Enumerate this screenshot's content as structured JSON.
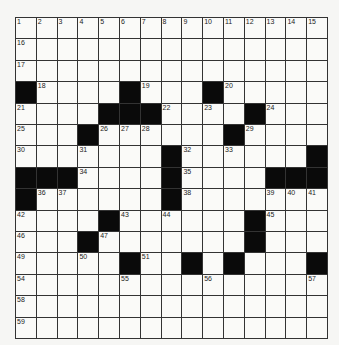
{
  "puzzle": {
    "rows": 15,
    "cols": 15,
    "grid": [
      "...............",
      "...............",
      "...............",
      "#....#...#.....",
      "....###....#...",
      "...#......#....",
      ".......#......#",
      "###....#....###",
      "#......#.......",
      "....#......#...",
      "...#.......#...",
      ".....#..#.#...#",
      "...............",
      "...............",
      "..............."
    ],
    "numbers": [
      {
        "r": 0,
        "c": 0,
        "n": "1"
      },
      {
        "r": 0,
        "c": 1,
        "n": "2"
      },
      {
        "r": 0,
        "c": 2,
        "n": "3"
      },
      {
        "r": 0,
        "c": 3,
        "n": "4"
      },
      {
        "r": 0,
        "c": 4,
        "n": "5"
      },
      {
        "r": 0,
        "c": 5,
        "n": "6"
      },
      {
        "r": 0,
        "c": 6,
        "n": "7"
      },
      {
        "r": 0,
        "c": 7,
        "n": "8"
      },
      {
        "r": 0,
        "c": 8,
        "n": "9"
      },
      {
        "r": 0,
        "c": 9,
        "n": "10"
      },
      {
        "r": 0,
        "c": 10,
        "n": "11"
      },
      {
        "r": 0,
        "c": 11,
        "n": "12"
      },
      {
        "r": 0,
        "c": 12,
        "n": "13"
      },
      {
        "r": 0,
        "c": 13,
        "n": "14"
      },
      {
        "r": 0,
        "c": 14,
        "n": "15"
      },
      {
        "r": 1,
        "c": 0,
        "n": "16"
      },
      {
        "r": 2,
        "c": 0,
        "n": "17"
      },
      {
        "r": 3,
        "c": 1,
        "n": "18"
      },
      {
        "r": 3,
        "c": 6,
        "n": "19"
      },
      {
        "r": 3,
        "c": 10,
        "n": "20"
      },
      {
        "r": 4,
        "c": 0,
        "n": "21"
      },
      {
        "r": 4,
        "c": 7,
        "n": "22"
      },
      {
        "r": 4,
        "c": 9,
        "n": "23"
      },
      {
        "r": 4,
        "c": 12,
        "n": "24"
      },
      {
        "r": 5,
        "c": 0,
        "n": "25"
      },
      {
        "r": 5,
        "c": 4,
        "n": "26"
      },
      {
        "r": 5,
        "c": 5,
        "n": "27"
      },
      {
        "r": 5,
        "c": 6,
        "n": "28"
      },
      {
        "r": 5,
        "c": 11,
        "n": "29"
      },
      {
        "r": 6,
        "c": 0,
        "n": "30"
      },
      {
        "r": 6,
        "c": 3,
        "n": "31"
      },
      {
        "r": 6,
        "c": 8,
        "n": "32"
      },
      {
        "r": 6,
        "c": 10,
        "n": "33"
      },
      {
        "r": 7,
        "c": 3,
        "n": "34"
      },
      {
        "r": 7,
        "c": 8,
        "n": "35"
      },
      {
        "r": 8,
        "c": 1,
        "n": "36"
      },
      {
        "r": 8,
        "c": 2,
        "n": "37"
      },
      {
        "r": 8,
        "c": 8,
        "n": "38"
      },
      {
        "r": 8,
        "c": 12,
        "n": "39"
      },
      {
        "r": 8,
        "c": 13,
        "n": "40"
      },
      {
        "r": 8,
        "c": 14,
        "n": "41"
      },
      {
        "r": 9,
        "c": 0,
        "n": "42"
      },
      {
        "r": 9,
        "c": 5,
        "n": "43"
      },
      {
        "r": 9,
        "c": 7,
        "n": "44"
      },
      {
        "r": 9,
        "c": 12,
        "n": "45"
      },
      {
        "r": 10,
        "c": 0,
        "n": "46"
      },
      {
        "r": 10,
        "c": 4,
        "n": "47"
      },
      {
        "r": 10,
        "c": 11,
        "n": "48"
      },
      {
        "r": 11,
        "c": 0,
        "n": "49"
      },
      {
        "r": 11,
        "c": 3,
        "n": "50"
      },
      {
        "r": 11,
        "c": 6,
        "n": "51"
      },
      {
        "r": 11,
        "c": 8,
        "n": "52"
      },
      {
        "r": 11,
        "c": 10,
        "n": "53"
      },
      {
        "r": 12,
        "c": 0,
        "n": "54"
      },
      {
        "r": 12,
        "c": 5,
        "n": "55"
      },
      {
        "r": 12,
        "c": 9,
        "n": "56"
      },
      {
        "r": 12,
        "c": 14,
        "n": "57"
      },
      {
        "r": 13,
        "c": 0,
        "n": "58"
      },
      {
        "r": 14,
        "c": 0,
        "n": "59"
      }
    ]
  }
}
